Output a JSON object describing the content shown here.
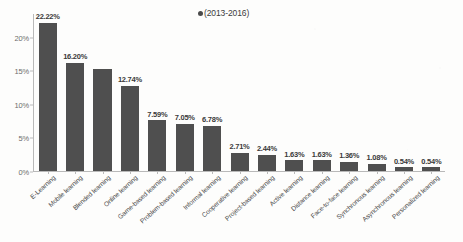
{
  "chart_data": {
    "type": "bar",
    "title": "",
    "subtitle": "",
    "xlabel": "",
    "ylabel": "",
    "legend": {
      "position": "top-center",
      "marker": "dot-marker",
      "entries": [
        "(2013-2016)"
      ]
    },
    "grid": false,
    "ylim": [
      0,
      23.5
    ],
    "ytick_labels": [
      "0%",
      "5%",
      "10%",
      "15%",
      "20%"
    ],
    "ytick_values": [
      0,
      5,
      10,
      15,
      20
    ],
    "categories": [
      "E-Learning",
      "Mobile learning",
      "Blended learning",
      "Online learning",
      "Game-based learning",
      "Problem-based learning",
      "Informal learning",
      "Cooperative learning",
      "Project-based learning",
      "Active learning",
      "Distance learning",
      "Face-to-face learning",
      "Synchronous learning",
      "Asynchronous learning",
      "Personalized learning"
    ],
    "values": [
      22.22,
      16.2,
      15.22,
      12.74,
      7.59,
      7.05,
      6.78,
      2.71,
      2.44,
      1.63,
      1.63,
      1.36,
      1.08,
      0.54,
      0.54
    ],
    "data_labels": [
      "22.22%",
      "16.20%",
      "",
      "12.74%",
      "7.59%",
      "7.05%",
      "6.78%",
      "2.71%",
      "2.44%",
      "1.63%",
      "1.63%",
      "1.36%",
      "1.08%",
      "0.54%",
      "0.54%"
    ],
    "series": [
      {
        "name": "(2013-2016)",
        "color": "#4f4f4f",
        "values": [
          22.22,
          16.2,
          15.22,
          12.74,
          7.59,
          7.05,
          6.78,
          2.71,
          2.44,
          1.63,
          1.63,
          1.36,
          1.08,
          0.54,
          0.54
        ]
      }
    ],
    "colors": {
      "bar": "#4f4f4f",
      "axis": "#b9b9b9",
      "text": "#3a3a3a",
      "background": "#fdfdfc"
    }
  }
}
